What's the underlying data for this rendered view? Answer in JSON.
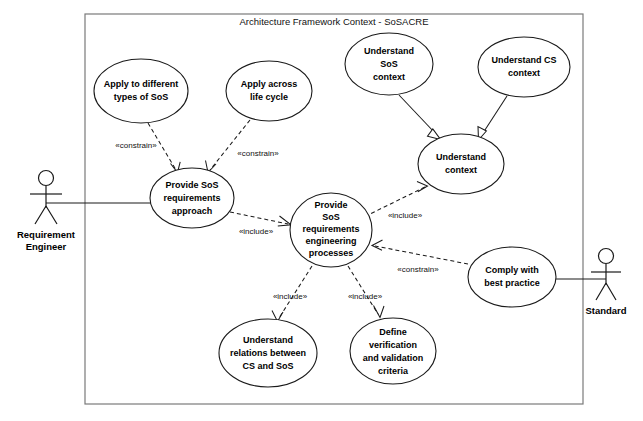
{
  "diagram": {
    "kind": "uml-use-case-diagram",
    "frame_title": "Architecture Framework Context - SoSACRE",
    "boundary": {
      "x": 85,
      "y": 14,
      "width": 498,
      "height": 390
    },
    "actors": [
      {
        "id": "requirement-engineer",
        "label_line1": "Requirement",
        "label_line2": "Engineer",
        "x": 46,
        "y": 178
      },
      {
        "id": "standard",
        "label_line1": "Standard",
        "label_line2": "",
        "x": 606,
        "y": 256
      }
    ],
    "use_cases": [
      {
        "id": "apply-different-types",
        "lines": [
          "Apply to different",
          "types of SoS"
        ],
        "cx": 141,
        "cy": 91,
        "rx": 47,
        "ry": 32
      },
      {
        "id": "apply-across-life-cycle",
        "lines": [
          "Apply across",
          "life cycle"
        ],
        "cx": 269,
        "cy": 91,
        "rx": 43,
        "ry": 30
      },
      {
        "id": "understand-sos-context",
        "lines": [
          "Understand",
          "SoS",
          "context"
        ],
        "cx": 389,
        "cy": 64,
        "rx": 44,
        "ry": 31
      },
      {
        "id": "understand-cs-context",
        "lines": [
          "Understand CS",
          "context"
        ],
        "cx": 524,
        "cy": 67,
        "rx": 46,
        "ry": 30
      },
      {
        "id": "understand-context",
        "lines": [
          "Understand",
          "context"
        ],
        "cx": 461,
        "cy": 164,
        "rx": 43,
        "ry": 30
      },
      {
        "id": "provide-sos-req-approach",
        "lines": [
          "Provide SoS",
          "requirements",
          "approach"
        ],
        "cx": 192,
        "cy": 198,
        "rx": 42,
        "ry": 30
      },
      {
        "id": "provide-sos-req-eng-processes",
        "lines": [
          "Provide",
          "SoS",
          "requirements",
          "engineering",
          "processes"
        ],
        "cx": 331,
        "cy": 230,
        "rx": 41,
        "ry": 37
      },
      {
        "id": "comply-with-best-practice",
        "lines": [
          "Comply with",
          "best practice"
        ],
        "cx": 512,
        "cy": 277,
        "rx": 44,
        "ry": 30
      },
      {
        "id": "understand-relations-cs-sos",
        "lines": [
          "Understand",
          "relations between",
          "CS and SoS"
        ],
        "cx": 268,
        "cy": 353,
        "rx": 49,
        "ry": 34
      },
      {
        "id": "define-verification-validation",
        "lines": [
          "Define",
          "verification",
          "and validation",
          "criteria"
        ],
        "cx": 393,
        "cy": 351,
        "rx": 43,
        "ry": 33
      }
    ],
    "relationships": [
      {
        "id": "constrain-types-to-approach",
        "stereotype": "«constrain»",
        "kind": "dependency",
        "label_x": 136,
        "label_y": 145,
        "from": "apply-different-types",
        "to": "provide-sos-req-approach"
      },
      {
        "id": "constrain-lifecycle-to-approach",
        "stereotype": "«constrain»",
        "kind": "dependency",
        "label_x": 256,
        "label_y": 153,
        "from": "apply-across-life-cycle",
        "to": "provide-sos-req-approach"
      },
      {
        "id": "include-approach-to-processes",
        "stereotype": "«include»",
        "kind": "dependency",
        "label_x": 255,
        "label_y": 231,
        "from": "provide-sos-req-approach",
        "to": "provide-sos-req-eng-processes"
      },
      {
        "id": "include-processes-to-understand-context",
        "stereotype": "«include»",
        "kind": "dependency",
        "label_x": 404,
        "label_y": 215,
        "from": "provide-sos-req-eng-processes",
        "to": "understand-context"
      },
      {
        "id": "constrain-bestpractice-to-processes",
        "stereotype": "«constrain»",
        "kind": "dependency",
        "label_x": 416,
        "label_y": 268,
        "from": "comply-with-best-practice",
        "to": "provide-sos-req-eng-processes"
      },
      {
        "id": "include-processes-to-relations",
        "stereotype": "«include»",
        "kind": "dependency",
        "label_x": 290,
        "label_y": 296,
        "from": "provide-sos-req-eng-processes",
        "to": "understand-relations-cs-sos"
      },
      {
        "id": "include-processes-to-verification",
        "stereotype": "«include»",
        "kind": "dependency",
        "label_x": 365,
        "label_y": 296,
        "from": "provide-sos-req-eng-processes",
        "to": "define-verification-validation"
      },
      {
        "id": "generalize-sos-context-to-context",
        "stereotype": "",
        "kind": "generalization",
        "from": "understand-sos-context",
        "to": "understand-context"
      },
      {
        "id": "generalize-cs-context-to-context",
        "stereotype": "",
        "kind": "generalization",
        "from": "understand-cs-context",
        "to": "understand-context"
      },
      {
        "id": "assoc-engineer-to-approach",
        "stereotype": "",
        "kind": "association",
        "from": "requirement-engineer",
        "to": "provide-sos-req-approach"
      },
      {
        "id": "assoc-standard-to-bestpractice",
        "stereotype": "",
        "kind": "association",
        "from": "standard",
        "to": "comply-with-best-practice"
      }
    ],
    "colors": {
      "stroke": "#1a1a1a",
      "boundary_stroke": "#7a7a7a",
      "fill": "#ffffff",
      "text": "#000000"
    }
  }
}
